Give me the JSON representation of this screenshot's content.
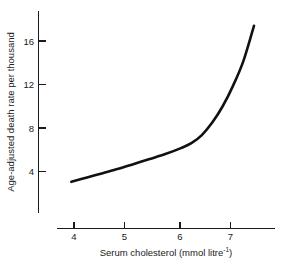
{
  "chart_data": {
    "type": "line",
    "title": "",
    "xlabel": "Serum cholesterol (mmol litre⁻¹)",
    "xlabel_main": "Serum cholesterol (mmol litre",
    "xlabel_sup": "-1",
    "xlabel_close": ")",
    "ylabel": "Age-adjusted death rate per thousand",
    "xlim": [
      3.6,
      7.85
    ],
    "ylim": [
      0.0,
      18.6
    ],
    "grid": false,
    "legend": null,
    "x_ticks": [
      4,
      5,
      6,
      7
    ],
    "x_tick_labels": [
      "4",
      "5",
      "6",
      "7"
    ],
    "y_ticks": [
      4,
      8,
      12,
      16
    ],
    "y_tick_labels": [
      "4",
      "8",
      "12",
      "16"
    ],
    "series": [
      {
        "name": "Age-adjusted death rate",
        "x": [
          3.95,
          4.25,
          4.55,
          4.85,
          5.15,
          5.45,
          5.75,
          6.05,
          6.25,
          6.45,
          6.65,
          6.85,
          7.05,
          7.25,
          7.45
        ],
        "y": [
          3.05,
          3.45,
          3.85,
          4.25,
          4.7,
          5.15,
          5.6,
          6.15,
          6.6,
          7.35,
          8.5,
          10.0,
          11.9,
          14.2,
          17.4
        ]
      }
    ],
    "annotations": []
  },
  "style": {
    "background": "#ffffff",
    "curve_color": "#111111",
    "axis_color": "#1a1a1a",
    "text_color": "#1a1a1a"
  }
}
